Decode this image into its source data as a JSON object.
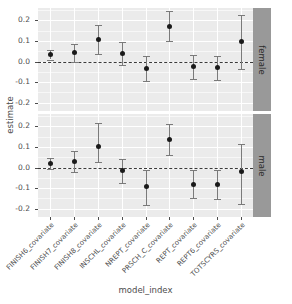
{
  "chart_data": {
    "type": "scatter",
    "title": "",
    "subtitle": "",
    "xlabel": "model_index",
    "ylabel": "estimate",
    "grid": true,
    "legend": false,
    "ylim": [
      -0.24,
      0.26
    ],
    "yticks": [
      "0.2",
      "0.1",
      "0.0",
      "-0.1",
      "-0.2"
    ],
    "ytick_values": [
      0.2,
      0.1,
      0.0,
      -0.1,
      -0.2
    ],
    "categories": [
      "FINISH6_covariate",
      "FINISH7_covariate",
      "FINISH8_covariate",
      "INSCHL_covariate",
      "NREPT_covariate",
      "PRSCH_C_covariate",
      "REPT_covariate",
      "REPT6_covariate",
      "TOTSCYRS_covariate"
    ],
    "facets": [
      {
        "label": "female",
        "estimates": [
          0.033,
          0.044,
          0.108,
          0.038,
          -0.032,
          0.172,
          -0.026,
          -0.03,
          0.097
        ],
        "lower": [
          0.01,
          0.0,
          0.037,
          -0.017,
          -0.092,
          0.1,
          -0.085,
          -0.088,
          -0.035
        ],
        "upper": [
          0.055,
          0.087,
          0.178,
          0.095,
          0.028,
          0.245,
          0.032,
          0.027,
          0.228
        ]
      },
      {
        "label": "male",
        "estimates": [
          0.019,
          0.03,
          0.101,
          -0.012,
          -0.093,
          0.137,
          -0.08,
          -0.082,
          -0.02
        ],
        "lower": [
          -0.005,
          -0.022,
          0.025,
          -0.075,
          -0.18,
          0.063,
          -0.148,
          -0.152,
          -0.175
        ],
        "upper": [
          0.044,
          0.081,
          0.215,
          0.04,
          -0.01,
          0.213,
          -0.014,
          -0.014,
          0.113
        ]
      }
    ],
    "reference_line": 0.0,
    "colors": {
      "panel_background": "#ebebeb",
      "gridline_major": "#ffffff",
      "gridline_minor": "#f7f7f7",
      "point": "#1a1a1a",
      "errorbar": "#7a7a7a",
      "reference_line": "#3a3a3a",
      "strip_background": "#999999",
      "text": "#4d4d4d"
    }
  }
}
